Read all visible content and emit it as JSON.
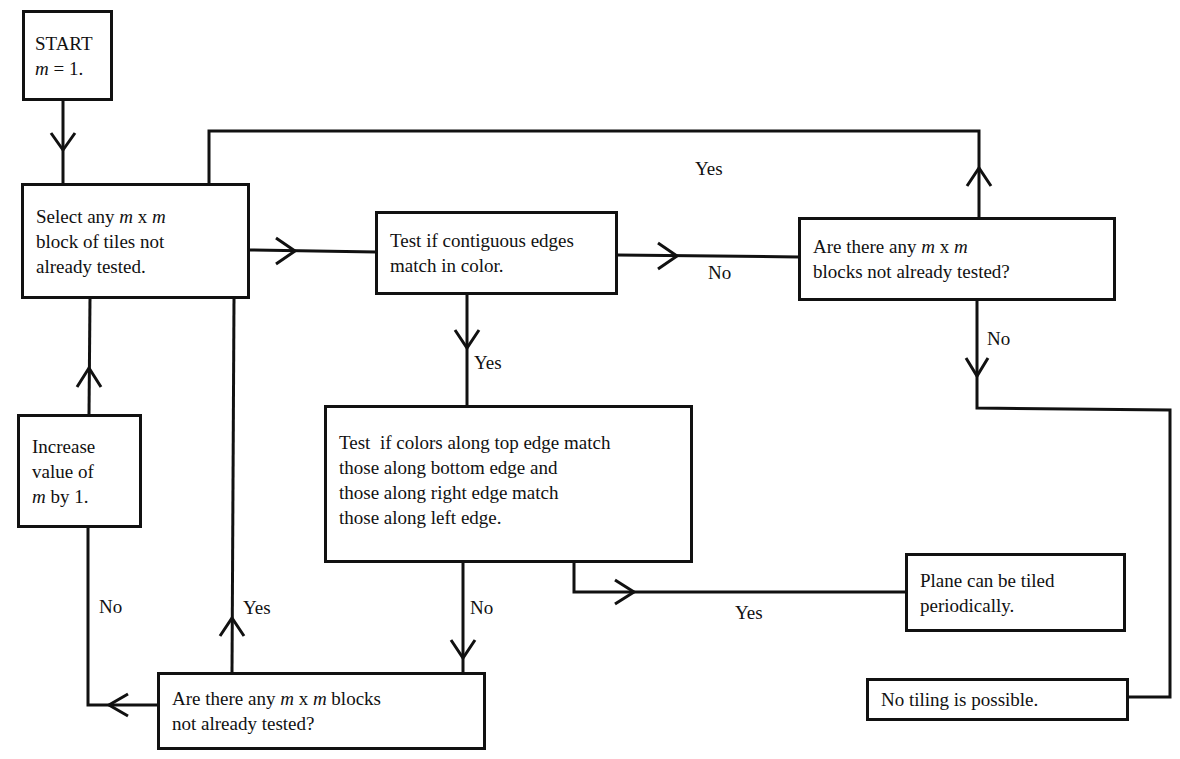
{
  "diagram": {
    "type": "flowchart",
    "nodes": {
      "start": {
        "lines": [
          "START",
          "m = 1."
        ]
      },
      "select": {
        "lines": [
          "Select any m x m",
          "block of tiles not",
          "already tested."
        ]
      },
      "test_contiguous": {
        "lines": [
          "Test if contiguous edges",
          "match in color."
        ]
      },
      "any_blocks_top": {
        "lines": [
          "Are there any m x m",
          "blocks not already tested?"
        ]
      },
      "test_periodic": {
        "lines": [
          "Test  if colors along top edge match",
          "those along bottom edge and",
          "those along right edge match",
          "those along left edge."
        ]
      },
      "plane_tiled": {
        "lines": [
          "Plane can be tiled",
          "periodically."
        ]
      },
      "no_tiling": {
        "lines": [
          "No tiling is possible."
        ]
      },
      "any_blocks_bottom": {
        "lines": [
          "Are there any m x m blocks",
          "not already tested?"
        ]
      },
      "increase_m": {
        "lines": [
          "Increase",
          "value of",
          "m by 1."
        ]
      }
    },
    "edge_labels": {
      "top_loop_yes": "Yes",
      "contiguous_no": "No",
      "contiguous_yes": "Yes",
      "top_blocks_no": "No",
      "periodic_no": "No",
      "periodic_yes": "Yes",
      "bottom_blocks_yes": "Yes",
      "bottom_blocks_no": "No"
    },
    "edges": [
      {
        "from": "start",
        "to": "select"
      },
      {
        "from": "select",
        "to": "test_contiguous"
      },
      {
        "from": "test_contiguous",
        "to": "any_blocks_top",
        "label": "No"
      },
      {
        "from": "any_blocks_top",
        "to": "select",
        "label": "Yes"
      },
      {
        "from": "any_blocks_top",
        "to": "no_tiling",
        "label": "No"
      },
      {
        "from": "test_contiguous",
        "to": "test_periodic",
        "label": "Yes"
      },
      {
        "from": "test_periodic",
        "to": "plane_tiled",
        "label": "Yes"
      },
      {
        "from": "test_periodic",
        "to": "any_blocks_bottom",
        "label": "No"
      },
      {
        "from": "any_blocks_bottom",
        "to": "select",
        "label": "Yes"
      },
      {
        "from": "any_blocks_bottom",
        "to": "increase_m",
        "label": "No"
      },
      {
        "from": "increase_m",
        "to": "select"
      }
    ]
  }
}
